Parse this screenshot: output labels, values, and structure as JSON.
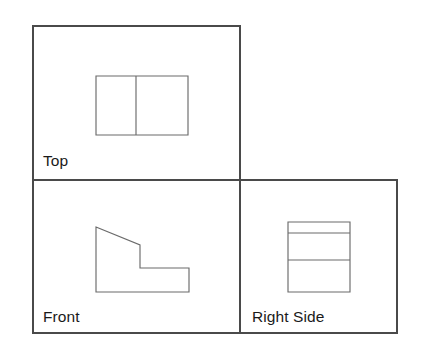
{
  "document": {
    "title": "Multiview Orthographic Projection",
    "background_color": "#ffffff",
    "line_color": "#4a4a4a",
    "part_line_color": "#6b6b6b",
    "label_color": "#1a1a1a"
  },
  "views": {
    "top": {
      "label": "Top",
      "frame": {
        "x": 33,
        "y": 26,
        "width": 207,
        "height": 154
      },
      "shape_name": "rectangle-with-vertical-divider",
      "shape": {
        "x": 96,
        "y": 76,
        "width": 92,
        "height": 59
      },
      "divider_x": 136
    },
    "front": {
      "label": "Front",
      "frame": {
        "x": 33,
        "y": 180,
        "width": 207,
        "height": 153
      },
      "shape_name": "stepped-profile-with-chamfer",
      "points": "96,227 140,245 140,268 189,268 189,292 96,292"
    },
    "right_side": {
      "label": "Right Side",
      "frame": {
        "x": 240,
        "y": 180,
        "width": 157,
        "height": 153
      },
      "shape_name": "rectangle-with-two-horizontal-lines",
      "shape": {
        "x": 288,
        "y": 222,
        "width": 62,
        "height": 70
      },
      "line_1_y": 233,
      "line_2_y": 260
    }
  }
}
